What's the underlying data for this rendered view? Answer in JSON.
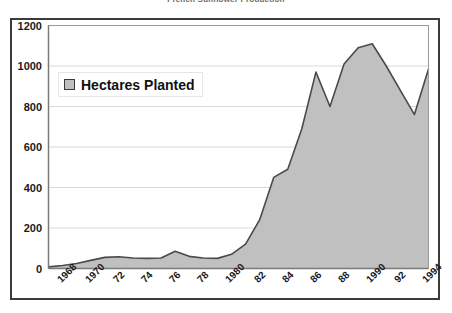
{
  "title": "French Sunflower Production",
  "legend": {
    "label": "Hectares Planted",
    "swatch_color": "#c0c0c0"
  },
  "axes": {
    "y_ticks": [
      "0",
      "200",
      "400",
      "600",
      "800",
      "1000",
      "1200"
    ],
    "x_ticks": [
      "1968",
      "1970",
      "72",
      "74",
      "76",
      "78",
      "1980",
      "82",
      "84",
      "86",
      "88",
      "1990",
      "92",
      "1994"
    ]
  },
  "colors": {
    "area_fill": "#c0c0c0",
    "area_stroke": "#4a4a4a",
    "frame": "#3b3b3b",
    "gridline": "#d9d9d9",
    "text": "#1a1a1a"
  },
  "chart_data": {
    "type": "area",
    "title": "French Sunflower Production",
    "xlabel": "",
    "ylabel": "",
    "ylim": [
      0,
      1200
    ],
    "grid": true,
    "legend_position": "inside-top-left",
    "categories": [
      1968,
      1969,
      1970,
      1971,
      1972,
      1973,
      1974,
      1975,
      1976,
      1977,
      1978,
      1979,
      1980,
      1981,
      1982,
      1983,
      1984,
      1985,
      1986,
      1987,
      1988,
      1989,
      1990,
      1991,
      1992,
      1993,
      1994,
      1995
    ],
    "tick_labels": [
      "1968",
      "1970",
      "72",
      "74",
      "76",
      "78",
      "1980",
      "82",
      "84",
      "86",
      "88",
      "1990",
      "92",
      "1994"
    ],
    "series": [
      {
        "name": "Hectares Planted",
        "values": [
          8,
          15,
          25,
          40,
          55,
          58,
          52,
          50,
          52,
          85,
          60,
          52,
          50,
          70,
          120,
          240,
          450,
          490,
          690,
          970,
          800,
          1010,
          1090,
          1110,
          1000,
          880,
          760,
          985
        ]
      }
    ]
  }
}
